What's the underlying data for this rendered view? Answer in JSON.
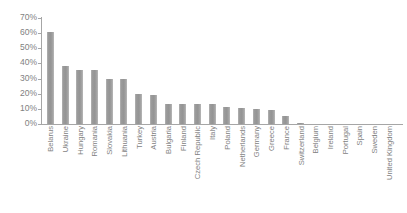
{
  "chart_data": {
    "type": "bar",
    "title": "",
    "subtitle": "",
    "xlabel": "",
    "ylabel": "",
    "ylim": [
      0,
      70
    ],
    "ytick_labels": [
      "70%",
      "60%",
      "50%",
      "40%",
      "30%",
      "20%",
      "10%",
      "0%"
    ],
    "ytick_values": [
      70,
      60,
      50,
      40,
      30,
      20,
      10,
      0
    ],
    "grid": false,
    "legend": false,
    "legend_position": "none",
    "bar_color": "#999999",
    "axis_color": "#a6a6a6",
    "text_color": "#7f7f7f",
    "value_unit": "%",
    "categories": [
      "Belarus",
      "Ukraine",
      "Hungary",
      "Romania",
      "Slovakia",
      "Lithuania",
      "Turkey",
      "Austria",
      "Bulgaria",
      "Finland",
      "Czech Republic",
      "Italy",
      "Poland",
      "Netherlands",
      "Germany",
      "Greece",
      "France",
      "Switzerland",
      "Belgium",
      "Ireland",
      "Portugal",
      "Spain",
      "Sweden",
      "United Kingdom"
    ],
    "values": [
      61,
      38,
      36,
      36,
      30,
      30,
      20,
      19,
      13.5,
      13.5,
      13.5,
      13.5,
      11,
      10.5,
      10,
      9,
      5,
      1,
      0,
      0,
      0,
      0,
      0,
      0
    ]
  }
}
